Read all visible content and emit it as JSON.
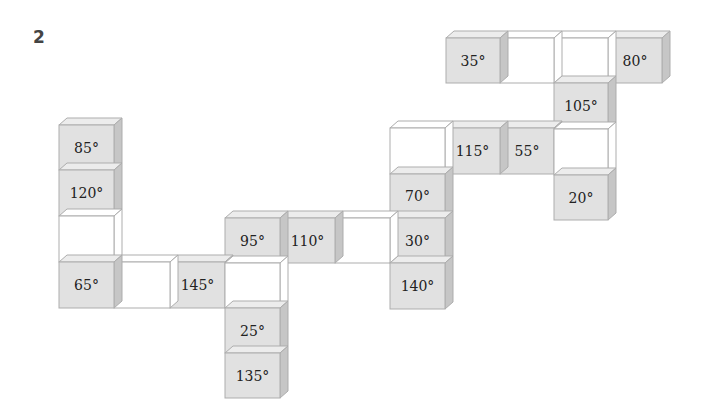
{
  "problem_number": "2",
  "colors": {
    "shaded_front": "#e1e1e1",
    "shaded_top": "#ececec",
    "shaded_side": "#c6c6c6",
    "blank_front": "#ffffff",
    "blank_top": "#ffffff",
    "blank_side": "#ffffff",
    "edge": "#adadad"
  },
  "cube": {
    "depth_dx": 8,
    "depth_dy": 7
  },
  "cubes": [
    {
      "label": "35°",
      "shaded": true,
      "x": 446,
      "y": 38,
      "w": 54,
      "h": 45
    },
    {
      "label": "",
      "shaded": false,
      "x": 500,
      "y": 38,
      "w": 54,
      "h": 45
    },
    {
      "label": "",
      "shaded": false,
      "x": 554,
      "y": 38,
      "w": 54,
      "h": 45
    },
    {
      "label": "80°",
      "shaded": true,
      "x": 608,
      "y": 38,
      "w": 54,
      "h": 45
    },
    {
      "label": "105°",
      "shaded": true,
      "x": 554,
      "y": 83,
      "w": 54,
      "h": 46
    },
    {
      "label": "",
      "shaded": false,
      "x": 554,
      "y": 129,
      "w": 54,
      "h": 46
    },
    {
      "label": "20°",
      "shaded": true,
      "x": 554,
      "y": 175,
      "w": 54,
      "h": 45
    },
    {
      "label": "",
      "shaded": false,
      "x": 390,
      "y": 128,
      "w": 55,
      "h": 46
    },
    {
      "label": "115°",
      "shaded": true,
      "x": 445,
      "y": 128,
      "w": 55,
      "h": 46
    },
    {
      "label": "55°",
      "shaded": true,
      "x": 500,
      "y": 128,
      "w": 54,
      "h": 46
    },
    {
      "label": "70°",
      "shaded": true,
      "x": 390,
      "y": 174,
      "w": 55,
      "h": 44
    },
    {
      "label": "30°",
      "shaded": true,
      "x": 390,
      "y": 218,
      "w": 55,
      "h": 45
    },
    {
      "label": "140°",
      "shaded": true,
      "x": 390,
      "y": 263,
      "w": 55,
      "h": 46
    },
    {
      "label": "95°",
      "shaded": true,
      "x": 225,
      "y": 218,
      "w": 55,
      "h": 45
    },
    {
      "label": "110°",
      "shaded": true,
      "x": 280,
      "y": 218,
      "w": 55,
      "h": 45
    },
    {
      "label": "",
      "shaded": false,
      "x": 335,
      "y": 218,
      "w": 55,
      "h": 45
    },
    {
      "label": "",
      "shaded": false,
      "x": 225,
      "y": 263,
      "w": 55,
      "h": 45
    },
    {
      "label": "25°",
      "shaded": true,
      "x": 225,
      "y": 308,
      "w": 55,
      "h": 45
    },
    {
      "label": "135°",
      "shaded": true,
      "x": 225,
      "y": 353,
      "w": 55,
      "h": 45
    },
    {
      "label": "85°",
      "shaded": true,
      "x": 59,
      "y": 125,
      "w": 55,
      "h": 45
    },
    {
      "label": "120°",
      "shaded": true,
      "x": 59,
      "y": 170,
      "w": 55,
      "h": 46
    },
    {
      "label": "",
      "shaded": false,
      "x": 59,
      "y": 216,
      "w": 55,
      "h": 46
    },
    {
      "label": "65°",
      "shaded": true,
      "x": 59,
      "y": 262,
      "w": 55,
      "h": 46
    },
    {
      "label": "",
      "shaded": false,
      "x": 114,
      "y": 262,
      "w": 56,
      "h": 46
    },
    {
      "label": "145°",
      "shaded": true,
      "x": 170,
      "y": 262,
      "w": 55,
      "h": 46
    }
  ]
}
